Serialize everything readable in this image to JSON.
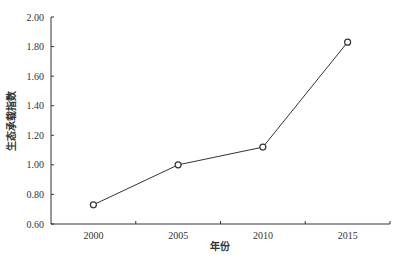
{
  "chart_data": {
    "type": "line",
    "title": "",
    "xlabel": "年份",
    "ylabel": "生态承载指数",
    "categories": [
      "2000",
      "2005",
      "2010",
      "2015"
    ],
    "series": [
      {
        "name": "生态承载指数",
        "values": [
          0.73,
          1.0,
          1.12,
          1.83
        ],
        "marker": "circle-open",
        "color": "#333333"
      }
    ],
    "ylim": [
      0.6,
      2.0
    ],
    "yticks": [
      "0.60",
      "0.80",
      "1.00",
      "1.20",
      "1.40",
      "1.60",
      "1.80",
      "2.00"
    ],
    "grid": false,
    "legend": null
  }
}
